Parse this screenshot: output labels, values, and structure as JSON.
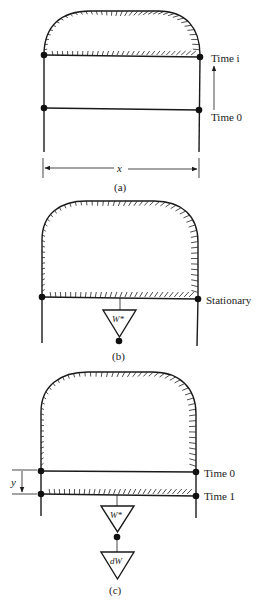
{
  "figure": {
    "panels": [
      {
        "id": "a",
        "caption": "(a)",
        "labels": {
          "upper_line": "Time i",
          "lower_line": "Time 0",
          "width": "x"
        }
      },
      {
        "id": "b",
        "caption": "(b)",
        "labels": {
          "bottom_line": "Stationary",
          "weight": "W*"
        }
      },
      {
        "id": "c",
        "caption": "(c)",
        "labels": {
          "upper_line": "Time 0",
          "lower_line": "Time 1",
          "displacement": "y",
          "weight": "W*",
          "added_weight": "dW"
        }
      }
    ]
  }
}
